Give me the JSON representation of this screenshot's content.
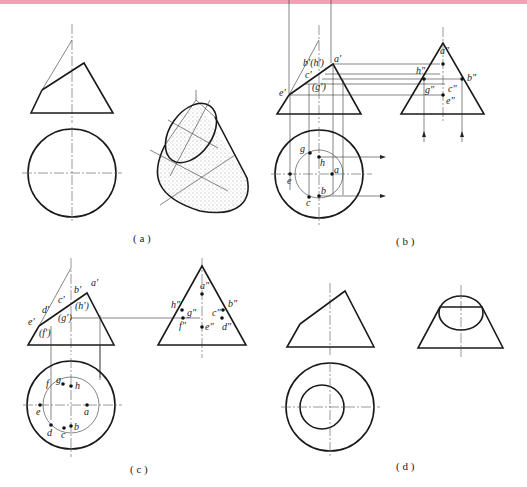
{
  "figure": {
    "top_bar_color": "#f4a0b4",
    "panels": [
      {
        "id": "a",
        "caption": "( a )"
      },
      {
        "id": "b",
        "caption": "( b )"
      },
      {
        "id": "c",
        "caption": "( c )"
      },
      {
        "id": "d",
        "caption": "( d )"
      }
    ],
    "panel_b": {
      "front_labels": [
        "a'",
        "b'(h')",
        "c'",
        "(g')",
        "e'"
      ],
      "side_labels": [
        "a\"",
        "h\"",
        "b\"",
        "g\"",
        "c\"",
        "e\""
      ],
      "top_labels": [
        "g",
        "h",
        "a",
        "e",
        "b",
        "c"
      ]
    },
    "panel_c": {
      "front_labels": [
        "a'",
        "b'",
        "c'",
        "d'",
        "(h')",
        "e'",
        "(g')",
        "(f')"
      ],
      "side_labels": [
        "a\"",
        "h\"",
        "g\"",
        "c\"",
        "b\"",
        "f\"",
        "e\"",
        "d\""
      ],
      "top_labels": [
        "f",
        "g",
        "h",
        "e",
        "a",
        "d",
        "c",
        "b"
      ]
    }
  }
}
